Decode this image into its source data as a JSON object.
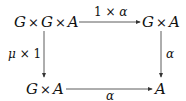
{
  "diagram": {
    "type": "commutative-square",
    "nodes": {
      "top_left": {
        "parts": [
          "G",
          "×",
          "G",
          "×",
          "A"
        ]
      },
      "top_right": {
        "parts": [
          "G",
          "×",
          "A"
        ]
      },
      "bottom_left": {
        "parts": [
          "G",
          "×",
          "A"
        ]
      },
      "bottom_right": {
        "parts": [
          "A"
        ]
      }
    },
    "arrows": {
      "top": {
        "from": "top_left",
        "to": "top_right",
        "label_parts": [
          "1",
          "×",
          "α"
        ]
      },
      "left": {
        "from": "top_left",
        "to": "bottom_left",
        "label_parts": [
          "μ",
          "×",
          "1"
        ]
      },
      "right": {
        "from": "top_right",
        "to": "bottom_right",
        "label_parts": [
          "α"
        ]
      },
      "bottom": {
        "from": "bottom_left",
        "to": "bottom_right",
        "label_parts": [
          "α"
        ]
      }
    },
    "stroke_color": "#333333"
  }
}
